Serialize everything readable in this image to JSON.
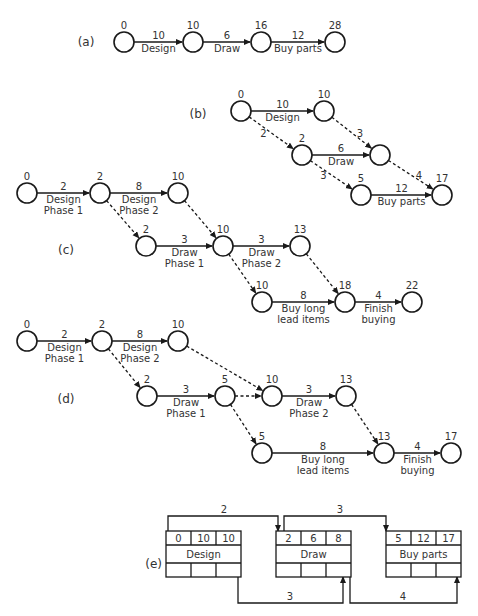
{
  "figure": {
    "parts": [
      {
        "id": "a",
        "label": "(a)",
        "label_pos": [
          86,
          46
        ],
        "nodes": [
          {
            "id": "a0",
            "x": 124,
            "y": 42,
            "time": "0"
          },
          {
            "id": "a1",
            "x": 193,
            "y": 42,
            "time": "10"
          },
          {
            "id": "a2",
            "x": 261,
            "y": 42,
            "time": "16"
          },
          {
            "id": "a3",
            "x": 335,
            "y": 42,
            "time": "28"
          }
        ],
        "edges": [
          {
            "from": "a0",
            "to": "a1",
            "duration": "10",
            "activity": [
              "Design"
            ],
            "dashed": false
          },
          {
            "from": "a1",
            "to": "a2",
            "duration": "6",
            "activity": [
              "Draw"
            ],
            "dashed": false
          },
          {
            "from": "a2",
            "to": "a3",
            "duration": "12",
            "activity": [
              "Buy parts"
            ],
            "dashed": false
          }
        ]
      },
      {
        "id": "b",
        "label": "(b)",
        "label_pos": [
          198,
          118
        ],
        "nodes": [
          {
            "id": "b0",
            "x": 241,
            "y": 111,
            "time": "0"
          },
          {
            "id": "b1",
            "x": 324,
            "y": 111,
            "time": "10"
          },
          {
            "id": "b2",
            "x": 302,
            "y": 155,
            "time": "2"
          },
          {
            "id": "b3",
            "x": 380,
            "y": 155,
            "time": ""
          },
          {
            "id": "b4",
            "x": 361,
            "y": 195,
            "time": "5"
          },
          {
            "id": "b5",
            "x": 442,
            "y": 195,
            "time": "17"
          }
        ],
        "edges": [
          {
            "from": "b0",
            "to": "b1",
            "duration": "10",
            "activity": [
              "Design"
            ],
            "dashed": false
          },
          {
            "from": "b0",
            "to": "b2",
            "duration": "2",
            "activity": [],
            "dashed": true,
            "label_side": "left"
          },
          {
            "from": "b1",
            "to": "b3",
            "duration": "3",
            "activity": [],
            "dashed": true,
            "label_side": "right"
          },
          {
            "from": "b2",
            "to": "b3",
            "duration": "6",
            "activity": [
              "Draw"
            ],
            "dashed": false
          },
          {
            "from": "b2",
            "to": "b4",
            "duration": "3",
            "activity": [],
            "dashed": true,
            "label_side": "left"
          },
          {
            "from": "b3",
            "to": "b5",
            "duration": "4",
            "activity": [],
            "dashed": true,
            "label_side": "right"
          },
          {
            "from": "b4",
            "to": "b5",
            "duration": "12",
            "activity": [
              "Buy parts"
            ],
            "dashed": false
          }
        ]
      },
      {
        "id": "c",
        "label": "(c)",
        "label_pos": [
          66,
          254
        ],
        "nodes": [
          {
            "id": "c0",
            "x": 27,
            "y": 193,
            "time": "0"
          },
          {
            "id": "c1",
            "x": 100,
            "y": 193,
            "time": "2"
          },
          {
            "id": "c2",
            "x": 178,
            "y": 193,
            "time": "10"
          },
          {
            "id": "c3",
            "x": 146,
            "y": 246,
            "time": "2"
          },
          {
            "id": "c4",
            "x": 223,
            "y": 246,
            "time": "10"
          },
          {
            "id": "c5",
            "x": 300,
            "y": 246,
            "time": "13"
          },
          {
            "id": "c6",
            "x": 262,
            "y": 302,
            "time": "10"
          },
          {
            "id": "c7",
            "x": 345,
            "y": 302,
            "time": "18"
          },
          {
            "id": "c8",
            "x": 412,
            "y": 302,
            "time": "22"
          }
        ],
        "edges": [
          {
            "from": "c0",
            "to": "c1",
            "duration": "2",
            "activity": [
              "Design",
              "Phase 1"
            ],
            "dashed": false
          },
          {
            "from": "c1",
            "to": "c2",
            "duration": "8",
            "activity": [
              "Design",
              "Phase 2"
            ],
            "dashed": false
          },
          {
            "from": "c1",
            "to": "c3",
            "duration": "",
            "activity": [],
            "dashed": true
          },
          {
            "from": "c2",
            "to": "c4",
            "duration": "",
            "activity": [],
            "dashed": true
          },
          {
            "from": "c3",
            "to": "c4",
            "duration": "3",
            "activity": [
              "Draw",
              "Phase 1"
            ],
            "dashed": false
          },
          {
            "from": "c4",
            "to": "c5",
            "duration": "3",
            "activity": [
              "Draw",
              "Phase 2"
            ],
            "dashed": false
          },
          {
            "from": "c4",
            "to": "c6",
            "duration": "",
            "activity": [],
            "dashed": true
          },
          {
            "from": "c5",
            "to": "c7",
            "duration": "",
            "activity": [],
            "dashed": true
          },
          {
            "from": "c6",
            "to": "c7",
            "duration": "8",
            "activity": [
              "Buy long",
              "lead items"
            ],
            "dashed": false
          },
          {
            "from": "c7",
            "to": "c8",
            "duration": "4",
            "activity": [
              "Finish",
              "buying"
            ],
            "dashed": false
          }
        ]
      },
      {
        "id": "d",
        "label": "(d)",
        "label_pos": [
          66,
          403
        ],
        "nodes": [
          {
            "id": "d0",
            "x": 27,
            "y": 341,
            "time": "0"
          },
          {
            "id": "d1",
            "x": 102,
            "y": 341,
            "time": "2"
          },
          {
            "id": "d2",
            "x": 178,
            "y": 341,
            "time": "10"
          },
          {
            "id": "d3",
            "x": 147,
            "y": 396,
            "time": "2"
          },
          {
            "id": "d4",
            "x": 225,
            "y": 396,
            "time": "5"
          },
          {
            "id": "d5",
            "x": 272,
            "y": 396,
            "time": "10"
          },
          {
            "id": "d6",
            "x": 346,
            "y": 396,
            "time": "13"
          },
          {
            "id": "d7",
            "x": 262,
            "y": 453,
            "time": "5"
          },
          {
            "id": "d8",
            "x": 384,
            "y": 453,
            "time": "13"
          },
          {
            "id": "d9",
            "x": 451,
            "y": 453,
            "time": "17"
          }
        ],
        "edges": [
          {
            "from": "d0",
            "to": "d1",
            "duration": "2",
            "activity": [
              "Design",
              "Phase 1"
            ],
            "dashed": false
          },
          {
            "from": "d1",
            "to": "d2",
            "duration": "8",
            "activity": [
              "Design",
              "Phase 2"
            ],
            "dashed": false
          },
          {
            "from": "d1",
            "to": "d3",
            "duration": "",
            "activity": [],
            "dashed": true
          },
          {
            "from": "d2",
            "to": "d5",
            "duration": "",
            "activity": [],
            "dashed": true
          },
          {
            "from": "d3",
            "to": "d4",
            "duration": "3",
            "activity": [
              "Draw",
              "Phase 1"
            ],
            "dashed": false
          },
          {
            "from": "d4",
            "to": "d5",
            "duration": "",
            "activity": [],
            "dashed": true
          },
          {
            "from": "d4",
            "to": "d7",
            "duration": "",
            "activity": [],
            "dashed": true
          },
          {
            "from": "d5",
            "to": "d6",
            "duration": "3",
            "activity": [
              "Draw",
              "Phase 2"
            ],
            "dashed": false
          },
          {
            "from": "d6",
            "to": "d8",
            "duration": "",
            "activity": [],
            "dashed": true
          },
          {
            "from": "d7",
            "to": "d8",
            "duration": "8",
            "activity": [
              "Buy long",
              "lead items"
            ],
            "dashed": false
          },
          {
            "from": "d8",
            "to": "d9",
            "duration": "4",
            "activity": [
              "Finish",
              "buying"
            ],
            "dashed": false
          }
        ]
      }
    ],
    "part_e": {
      "label": "(e)",
      "label_pos": [
        162,
        568
      ],
      "boxes": [
        {
          "id": "e-design",
          "x": 166,
          "y": 531,
          "w": 75,
          "h": 46,
          "top": [
            "0",
            "10",
            "10"
          ],
          "name": "Design"
        },
        {
          "id": "e-draw",
          "x": 276,
          "y": 531,
          "w": 75,
          "h": 46,
          "top": [
            "2",
            "6",
            "8"
          ],
          "name": "Draw"
        },
        {
          "id": "e-buy",
          "x": 386,
          "y": 531,
          "w": 75,
          "h": 46,
          "top": [
            "5",
            "12",
            "17"
          ],
          "name": "Buy parts"
        }
      ],
      "links": [
        {
          "label": "2",
          "points": [
            [
              168,
              531
            ],
            [
              168,
              516
            ],
            [
              278,
              516
            ],
            [
              278,
              531
            ]
          ],
          "label_pos": [
            224,
            513
          ]
        },
        {
          "label": "3",
          "points": [
            [
              284,
              531
            ],
            [
              284,
              516
            ],
            [
              386,
              516
            ],
            [
              386,
              531
            ]
          ],
          "label_pos": [
            340,
            513
          ]
        },
        {
          "label": "3",
          "points": [
            [
              238,
              577
            ],
            [
              238,
              603
            ],
            [
              343,
              603
            ],
            [
              343,
              577
            ]
          ],
          "label_pos": [
            290,
            600
          ]
        },
        {
          "label": "4",
          "points": [
            [
              350,
              577
            ],
            [
              350,
              603
            ],
            [
              457,
              603
            ],
            [
              457,
              577
            ]
          ],
          "label_pos": [
            403,
            600
          ]
        }
      ]
    }
  }
}
